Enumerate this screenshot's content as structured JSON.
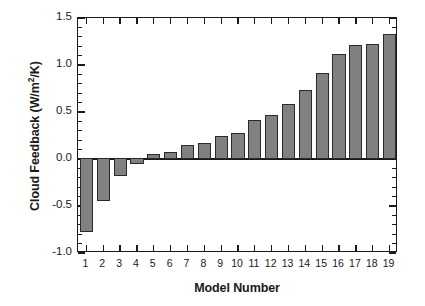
{
  "chart_data": {
    "type": "bar",
    "title": "",
    "xlabel": "Model Number",
    "ylabel": "Cloud Feedback (W/m",
    "ylabel_sup": "2",
    "ylabel_tail": "/K)",
    "ylabel_full": "Cloud Feedback (W/m 2/K)",
    "categories": [
      "1",
      "2",
      "3",
      "4",
      "5",
      "6",
      "7",
      "8",
      "9",
      "10",
      "11",
      "12",
      "13",
      "14",
      "15",
      "16",
      "17",
      "18",
      "19"
    ],
    "values": [
      -0.78,
      -0.45,
      -0.19,
      -0.06,
      0.05,
      0.07,
      0.15,
      0.17,
      0.25,
      0.28,
      0.42,
      0.47,
      0.59,
      0.73,
      0.91,
      1.12,
      1.21,
      1.22,
      1.33
    ],
    "ylim": [
      -1.0,
      1.5
    ],
    "ytick_labels": [
      "1.5",
      "1.0",
      "0.5",
      "0.0",
      "-0.5",
      "-1.0"
    ],
    "ytick_values": [
      1.5,
      1.0,
      0.5,
      0.0,
      -0.5,
      -1.0
    ],
    "yminor_step": 0.1,
    "xtick_labels": [
      "1",
      "2",
      "3",
      "4",
      "5",
      "6",
      "7",
      "8",
      "9",
      "10",
      "11",
      "12",
      "13",
      "14",
      "15",
      "16",
      "17",
      "18",
      "19"
    ],
    "grid": false,
    "legend": null,
    "bar_color": "#808080",
    "bar_edge_color": "#2b2b2b",
    "axis_color": "#1a1a1a",
    "background": "#ffffff"
  }
}
